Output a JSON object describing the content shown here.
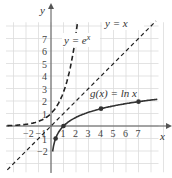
{
  "chart_data": {
    "type": "line",
    "title": "",
    "xlabel": "x",
    "ylabel": "y",
    "xlim": [
      -3,
      8.5
    ],
    "ylim": [
      -3,
      8
    ],
    "grid": true,
    "x_ticks": [
      "-2",
      "-1",
      "1",
      "2",
      "3",
      "4",
      "5",
      "6",
      "7"
    ],
    "y_ticks": [
      "-2",
      "-1",
      "1",
      "2",
      "3",
      "4",
      "5",
      "6",
      "7"
    ],
    "series": [
      {
        "name": "y = e^x",
        "style": "dashed",
        "function": "exp(x)",
        "x": [
          -3,
          -2,
          -1,
          0,
          1,
          1.5,
          2
        ],
        "y": [
          0.05,
          0.14,
          0.37,
          1,
          2.72,
          4.48,
          7.39
        ]
      },
      {
        "name": "y = x",
        "style": "dashed",
        "function": "x",
        "x": [
          -3,
          8
        ],
        "y": [
          -3,
          8
        ]
      },
      {
        "name": "g(x) = ln x",
        "style": "solid",
        "function": "ln(x)",
        "x": [
          0.14,
          0.37,
          1,
          4,
          7,
          8.5
        ],
        "y": [
          -2,
          -1,
          0,
          1.39,
          1.95,
          2.14
        ]
      }
    ],
    "points": [
      {
        "x": 0.37,
        "y": -1
      },
      {
        "x": 1,
        "y": 0
      },
      {
        "x": 4,
        "y": 1.39
      },
      {
        "x": 7,
        "y": 1.95
      }
    ],
    "annotations": [
      "y = x",
      "y = e^x",
      "g(x) = ln x"
    ]
  },
  "labels": {
    "x_axis": "x",
    "y_axis": "y",
    "line_yx": "y = x",
    "exp_prefix": "y = e",
    "exp_sup": "x",
    "ln_label": "g(x) = ln x"
  },
  "ticks": {
    "x": [
      {
        "v": -2,
        "t": "−2"
      },
      {
        "v": -1,
        "t": "−1"
      },
      {
        "v": 1,
        "t": "1"
      },
      {
        "v": 2,
        "t": "2"
      },
      {
        "v": 3,
        "t": "3"
      },
      {
        "v": 4,
        "t": "4"
      },
      {
        "v": 5,
        "t": "5"
      },
      {
        "v": 6,
        "t": "6"
      },
      {
        "v": 7,
        "t": "7"
      }
    ],
    "y": [
      {
        "v": 7,
        "t": "7"
      },
      {
        "v": 6,
        "t": "6"
      },
      {
        "v": 5,
        "t": "5"
      },
      {
        "v": 4,
        "t": "4"
      },
      {
        "v": 3,
        "t": "3"
      },
      {
        "v": 2,
        "t": "2"
      },
      {
        "v": 1,
        "t": "1"
      },
      {
        "v": -1,
        "t": "1"
      },
      {
        "v": -2,
        "t": "−2"
      }
    ]
  }
}
